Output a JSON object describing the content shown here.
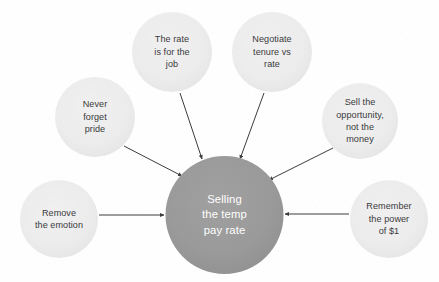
{
  "diagram": {
    "type": "hub-and-spoke-mind-map",
    "title": "Selling the temp pay rate",
    "background_color": "#fefefe",
    "hub": {
      "id": "hub",
      "label": "Selling\nthe temp\npay rate",
      "text_plain": "Selling the temp pay rate",
      "fill_color": "#9a9a9a",
      "text_color": "#ffffff",
      "cx": 224.5,
      "cy": 215,
      "r": 59
    },
    "satellites": [
      {
        "id": "never-forget-pride",
        "label": "Never\nforget\npride",
        "text_plain": "Never forget pride",
        "fill_color": "#ececec",
        "text_color": "#3a3a3c",
        "cx": 95,
        "cy": 117,
        "r": 40
      },
      {
        "id": "the-rate-is-for-the-job",
        "label": "The rate\nis for the\njob",
        "text_plain": "The rate is for the job",
        "fill_color": "#ececec",
        "text_color": "#3a3a3c",
        "cx": 172,
        "cy": 52,
        "r": 40
      },
      {
        "id": "negotiate-tenure-vs-rate",
        "label": "Negotiate\ntenure vs\nrate",
        "text_plain": "Negotiate tenure vs rate",
        "fill_color": "#ececec",
        "text_color": "#3a3a3c",
        "cx": 272,
        "cy": 52,
        "r": 40
      },
      {
        "id": "sell-the-opportunity-not-the-money",
        "label": "Sell the\nopportunity,\nnot the\nmoney",
        "text_plain": "Sell the opportunity, not the money",
        "fill_color": "#ececec",
        "text_color": "#3a3a3c",
        "cx": 360,
        "cy": 121,
        "r": 38
      },
      {
        "id": "remove-the-emotion",
        "label": "Remove\nthe emotion",
        "text_plain": "Remove the emotion",
        "fill_color": "#ececec",
        "text_color": "#3a3a3c",
        "cx": 59,
        "cy": 219,
        "r": 39
      },
      {
        "id": "remember-the-power-of-1",
        "label": "Remember\nthe power\nof $1",
        "text_plain": "Remember the power of $1",
        "fill_color": "#ececec",
        "text_color": "#3a3a3c",
        "cx": 389,
        "cy": 219,
        "r": 39
      }
    ],
    "connectors": [
      {
        "id": "arrow-never-forget-pride-to-hub",
        "from": "never-forget-pride",
        "to": "hub",
        "direction": "to-hub",
        "color": "#3d3d3f",
        "x1": 124,
        "y1": 146,
        "x2": 182,
        "y2": 176
      },
      {
        "id": "arrow-the-rate-is-for-the-job-to-hub",
        "from": "the-rate-is-for-the-job",
        "to": "hub",
        "direction": "to-hub",
        "color": "#3d3d3f",
        "x1": 180,
        "y1": 93,
        "x2": 202,
        "y2": 159
      },
      {
        "id": "arrow-negotiate-tenure-vs-rate-to-hub",
        "from": "negotiate-tenure-vs-rate",
        "to": "hub",
        "direction": "to-hub",
        "color": "#3d3d3f",
        "x1": 264,
        "y1": 93,
        "x2": 240,
        "y2": 159
      },
      {
        "id": "arrow-sell-the-opportunity-to-hub",
        "from": "sell-the-opportunity-not-the-money",
        "to": "hub",
        "direction": "to-hub",
        "color": "#3d3d3f",
        "x1": 333,
        "y1": 148,
        "x2": 269,
        "y2": 180
      },
      {
        "id": "arrow-remove-the-emotion-to-hub",
        "from": "remove-the-emotion",
        "to": "hub",
        "direction": "to-hub",
        "color": "#3d3d3f",
        "x1": 99,
        "y1": 215,
        "x2": 164,
        "y2": 215
      },
      {
        "id": "arrow-remember-the-power-to-hub",
        "from": "remember-the-power-of-1",
        "to": "hub",
        "direction": "to-hub",
        "color": "#3d3d3f",
        "x1": 349,
        "y1": 214,
        "x2": 285,
        "y2": 214
      }
    ]
  }
}
